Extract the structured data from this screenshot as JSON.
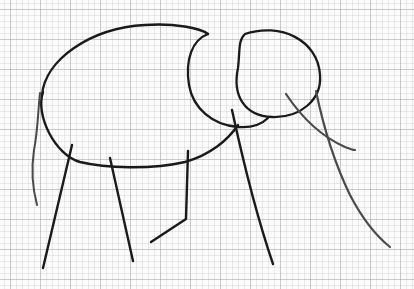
{
  "image": {
    "subject": "Hand-drawn pencil sketch of an elephant on graph paper",
    "paper": "graph-paper",
    "ink_color": "#1a1a1a",
    "light_ink_color": "#4a4a4a",
    "strokes": [
      {
        "name": "body-outline",
        "part": "body",
        "tone": "dark"
      },
      {
        "name": "head-circle-back",
        "part": "head",
        "tone": "dark"
      },
      {
        "name": "head-circle-front",
        "part": "head",
        "tone": "dark"
      },
      {
        "name": "tail",
        "part": "tail",
        "tone": "light"
      },
      {
        "name": "front-left-leg",
        "part": "leg",
        "tone": "dark"
      },
      {
        "name": "front-right-leg",
        "part": "leg",
        "tone": "dark"
      },
      {
        "name": "back-leg-bent",
        "part": "leg",
        "tone": "dark"
      },
      {
        "name": "front-leg-under-head",
        "part": "leg",
        "tone": "dark"
      },
      {
        "name": "trunk",
        "part": "trunk",
        "tone": "light"
      },
      {
        "name": "tusk",
        "part": "tusk",
        "tone": "light"
      }
    ]
  }
}
